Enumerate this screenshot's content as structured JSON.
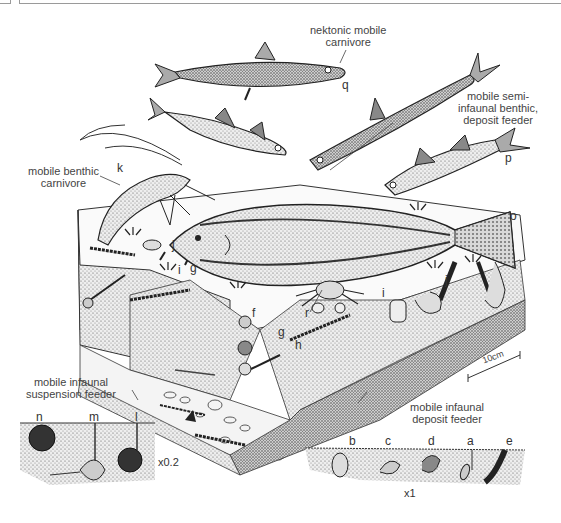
{
  "figure": {
    "type": "block diagram illustration",
    "scale_bar": "10cm",
    "inset_scales": {
      "suspension_feeder_inset": "x0.2",
      "deposit_feeder_inset": "x1"
    }
  },
  "captions": {
    "nektonic": {
      "line1": "nektonic mobile",
      "line2": "carnivore"
    },
    "semi_infaunal": {
      "line1": "mobile semi-",
      "line2": "infaunal benthic,",
      "line3": "deposit feeder"
    },
    "benthic_carnivore": {
      "line1": "mobile benthic",
      "line2": "carnivore"
    },
    "infaunal_suspension": {
      "line1": "mobile infaunal",
      "line2": "suspension feeder"
    },
    "infaunal_deposit": {
      "line1": "mobile infaunal",
      "line2": "deposit feeder"
    }
  },
  "labels": {
    "q": "q",
    "p": "p",
    "o": "o",
    "k": "k",
    "j1": "j",
    "i1": "i",
    "g1": "g",
    "f": "f",
    "g2": "g",
    "h": "h",
    "r": "r",
    "i2": "i",
    "j2": "j",
    "n": "n",
    "m": "m",
    "l": "l",
    "b": "b",
    "c": "c",
    "d": "d",
    "a": "a",
    "e": "e"
  },
  "organisms": [
    {
      "label": "q",
      "description": "slender fish swimming (nektonic)"
    },
    {
      "label": "p",
      "description": "fish near sediment surface"
    },
    {
      "label": "o",
      "description": "flatfish on sediment"
    },
    {
      "label": "k",
      "description": "shrimp / crustacean with long antennae"
    },
    {
      "label": "r",
      "description": "crab beneath flatfish"
    },
    {
      "label": "l",
      "description": "burrowing bivalve with siphon"
    },
    {
      "label": "m",
      "description": "burrowing bivalve with siphons"
    },
    {
      "label": "n",
      "description": "burrowing heart urchin"
    },
    {
      "label": "b",
      "description": "small infaunal bivalve"
    },
    {
      "label": "c",
      "description": "small infaunal bivalve"
    },
    {
      "label": "d",
      "description": "small infaunal bivalve"
    },
    {
      "label": "a",
      "description": "infaunal bivalve with siphon"
    },
    {
      "label": "e",
      "description": "elongate infaunal bivalve"
    }
  ]
}
